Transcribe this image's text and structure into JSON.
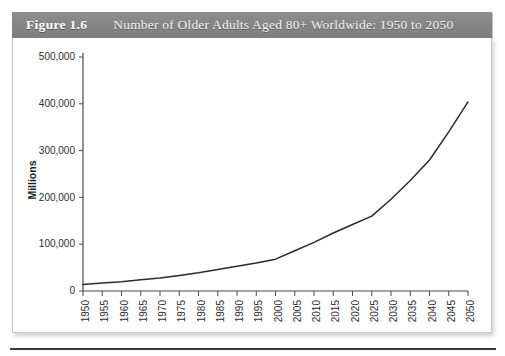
{
  "figure": {
    "label": "Figure 1.6",
    "title": "Number of Older Adults Aged 80+ Worldwide: 1950 to 2050"
  },
  "colors": {
    "caption_band": "#868686",
    "caption_text": "#ffffff",
    "panel_background": "#ffffff",
    "panel_border": "#c8c8c8",
    "axis": "#4a4a4a",
    "data_line": "#2b2b2b",
    "tick_text": "#2e2e2e",
    "bottom_rule": "#3a3a3a"
  },
  "chart_data": {
    "type": "line",
    "title": "Number of Older Adults Aged 80+ Worldwide: 1950 to 2050",
    "xlabel": "",
    "ylabel": "Millions",
    "xlim": [
      1950,
      2050
    ],
    "ylim": [
      0,
      500000
    ],
    "grid": false,
    "legend": null,
    "y_ticks": [
      0,
      100000,
      200000,
      300000,
      400000,
      500000
    ],
    "y_tick_labels": [
      "0",
      "100,000",
      "200,000",
      "300,000",
      "400,000",
      "500,000"
    ],
    "x": [
      1950,
      1955,
      1960,
      1965,
      1970,
      1975,
      1980,
      1985,
      1990,
      1995,
      2000,
      2005,
      2010,
      2015,
      2020,
      2025,
      2030,
      2035,
      2040,
      2045,
      2050
    ],
    "x_tick_labels": [
      "1950",
      "1955",
      "1960",
      "1965",
      "1970",
      "1975",
      "1980",
      "1985",
      "1990",
      "1995",
      "2000",
      "2005",
      "2010",
      "2015",
      "2020",
      "2025",
      "2030",
      "2035",
      "2040",
      "2045",
      "2050"
    ],
    "series": [
      {
        "name": "Older adults aged 80+",
        "values": [
          14000,
          17000,
          20000,
          24000,
          28000,
          33000,
          39000,
          46000,
          53000,
          60000,
          68000,
          86000,
          104000,
          124000,
          142000,
          160000,
          196000,
          236000,
          280000,
          340000,
          404000
        ]
      }
    ]
  }
}
